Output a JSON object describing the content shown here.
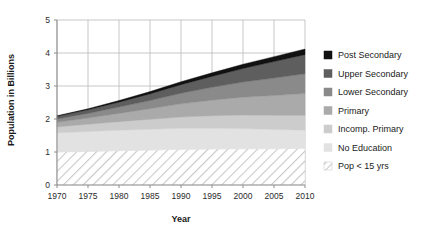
{
  "chart_data": {
    "type": "area",
    "title": "",
    "xlabel": "Year",
    "ylabel": "Population in Billions",
    "x": [
      1970,
      1975,
      1980,
      1985,
      1990,
      1995,
      2000,
      2005,
      2010
    ],
    "xlim": [
      1970,
      2010
    ],
    "ylim": [
      0,
      5
    ],
    "xticks": [
      1970,
      1975,
      1980,
      1985,
      1990,
      1995,
      2000,
      2005,
      2010
    ],
    "yticks": [
      0,
      1,
      2,
      3,
      4,
      5
    ],
    "grid": true,
    "legend_position": "right",
    "stack_order_bottom_to_top": [
      "Pop < 15 yrs",
      "No Education",
      "Incomp. Primary",
      "Primary",
      "Lower Secondary",
      "Upper Secondary",
      "Post Secondary"
    ],
    "series": [
      {
        "name": "Pop < 15 yrs",
        "color": "#ffffff",
        "pattern": "diagonal-hatch",
        "values": [
          1.0,
          1.02,
          1.04,
          1.06,
          1.08,
          1.09,
          1.1,
          1.1,
          1.11
        ]
      },
      {
        "name": "No Education",
        "color": "#e2e2e2",
        "pattern": "solid",
        "values": [
          0.58,
          0.6,
          0.62,
          0.63,
          0.64,
          0.63,
          0.61,
          0.58,
          0.55
        ]
      },
      {
        "name": "Incomp. Primary",
        "color": "#cccccc",
        "pattern": "solid",
        "values": [
          0.18,
          0.22,
          0.26,
          0.3,
          0.34,
          0.38,
          0.41,
          0.43,
          0.45
        ]
      },
      {
        "name": "Primary",
        "color": "#aaaaaa",
        "pattern": "solid",
        "values": [
          0.14,
          0.19,
          0.25,
          0.32,
          0.4,
          0.47,
          0.54,
          0.6,
          0.66
        ]
      },
      {
        "name": "Lower Secondary",
        "color": "#8a8a8a",
        "pattern": "solid",
        "values": [
          0.1,
          0.14,
          0.19,
          0.25,
          0.32,
          0.39,
          0.46,
          0.53,
          0.6
        ]
      },
      {
        "name": "Upper Secondary",
        "color": "#5e5e5e",
        "pattern": "solid",
        "values": [
          0.08,
          0.11,
          0.15,
          0.2,
          0.26,
          0.33,
          0.41,
          0.5,
          0.58
        ]
      },
      {
        "name": "Post Secondary",
        "color": "#111111",
        "pattern": "solid",
        "values": [
          0.02,
          0.03,
          0.05,
          0.07,
          0.09,
          0.11,
          0.13,
          0.15,
          0.17
        ]
      }
    ],
    "totals": [
      2.1,
      2.31,
      2.56,
      2.83,
      3.13,
      3.4,
      3.66,
      3.89,
      4.12
    ]
  },
  "legend": {
    "items": [
      {
        "label": "Post Secondary",
        "color": "#111111",
        "pattern": "solid"
      },
      {
        "label": "Upper Secondary",
        "color": "#5e5e5e",
        "pattern": "solid"
      },
      {
        "label": "Lower Secondary",
        "color": "#8a8a8a",
        "pattern": "solid"
      },
      {
        "label": "Primary",
        "color": "#aaaaaa",
        "pattern": "solid"
      },
      {
        "label": "Incomp. Primary",
        "color": "#cccccc",
        "pattern": "solid"
      },
      {
        "label": "No Education",
        "color": "#e2e2e2",
        "pattern": "solid"
      },
      {
        "label": "Pop < 15 yrs",
        "color": "#ffffff",
        "pattern": "diagonal-hatch"
      }
    ]
  },
  "style": {
    "grid_color": "#b9b9b9",
    "axis_color": "#8c8c8c",
    "text_color": "#1a1a1a",
    "background": "#ffffff"
  }
}
